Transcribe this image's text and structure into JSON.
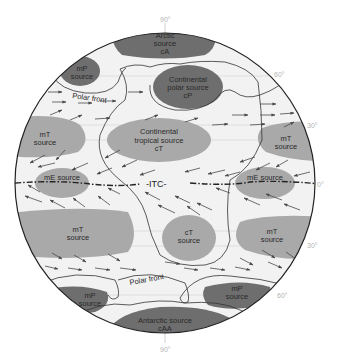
{
  "colors": {
    "background": "#ffffff",
    "globe_fill": "#f2f2f2",
    "dark_source": "#6e6e6e",
    "light_source": "#a9a9a9",
    "outline": "#333333",
    "arrow": "#4a4a4a",
    "degree_label": "#b4b4b4"
  },
  "latitude_labels": {
    "north_pole": "90°",
    "n60": "60°",
    "n30": "30°",
    "equator": "0°",
    "s30": "30°",
    "s60": "60°",
    "south_pole": "90°"
  },
  "sources": {
    "arctic": {
      "line1": "Arctic",
      "line2": "source",
      "line3": "cA"
    },
    "mp_nw": {
      "line1": "mP",
      "line2": "source"
    },
    "cp": {
      "line1": "Continental",
      "line2": "polar source",
      "line3": "cP"
    },
    "mt_nw": {
      "line1": "mT",
      "line2": "source"
    },
    "ct_n": {
      "line1": "Continental",
      "line2": "tropical source",
      "line3": "cT"
    },
    "mt_ne": {
      "line1": "mT",
      "line2": "source"
    },
    "me_w": {
      "line1": "mE source"
    },
    "me_e": {
      "line1": "mE source"
    },
    "mt_sw": {
      "line1": "mT",
      "line2": "source"
    },
    "ct_s": {
      "line1": "cT",
      "line2": "source"
    },
    "mt_se": {
      "line1": "mT",
      "line2": "source"
    },
    "mp_sw": {
      "line1": "mP",
      "line2": "source"
    },
    "mp_se": {
      "line1": "mP",
      "line2": "source"
    },
    "antarctic": {
      "line1": "Antarctic source",
      "line2": "cAA"
    }
  },
  "fronts": {
    "polar_front_north": "Polar front",
    "polar_front_south": "Polar front",
    "itc": "-ITC-"
  }
}
